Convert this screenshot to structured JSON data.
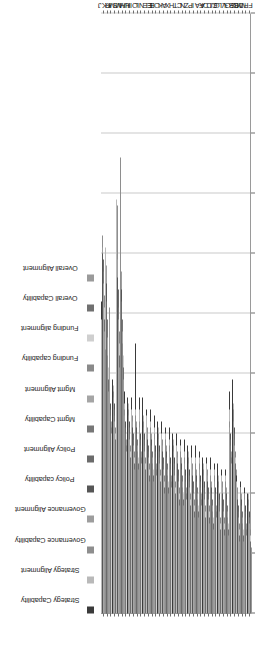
{
  "chart_data": {
    "type": "bar",
    "orientation": "horizontal",
    "title": "",
    "xlabel": "",
    "ylabel": "",
    "xlim": [
      0.0,
      5.0
    ],
    "xticks": [
      "0.00",
      "0.50",
      "1.00",
      "1.50",
      "2.00",
      "2.50",
      "3.00",
      "3.50",
      "4.00",
      "4.50",
      "5.00"
    ],
    "grid": true,
    "legend_position": "top",
    "legend": [
      {
        "label": "Strategy Capability",
        "color": "#3a3a3a"
      },
      {
        "label": "Strategy Alignment",
        "color": "#b9b9b9"
      },
      {
        "label": "Governance Capability",
        "color": "#8e8e8e"
      },
      {
        "label": "Governance Alignment",
        "color": "#9d9d9d"
      },
      {
        "label": "Policy capability",
        "color": "#565656"
      },
      {
        "label": "Policy Alignment",
        "color": "#6b6b6b"
      },
      {
        "label": "Mgmt Capability",
        "color": "#777777"
      },
      {
        "label": "Mgmt Alignment",
        "color": "#a5a5a5"
      },
      {
        "label": "Funding capability",
        "color": "#8a8a8a"
      },
      {
        "label": "Funding alignment",
        "color": "#cfcfcf"
      },
      {
        "label": "Overall Capability",
        "color": "#707070"
      },
      {
        "label": "Overall Alignment",
        "color": "#9a9a9a"
      }
    ],
    "categories": [
      "J",
      "KK",
      "R",
      "MM",
      "S",
      "W",
      "HH",
      "U",
      "II",
      "O",
      "L",
      "N",
      "EE",
      "E",
      "B",
      "O2",
      "K",
      "A",
      "X",
      "H",
      "T",
      "C",
      "N2",
      "Z",
      "P",
      "I",
      "AA",
      "F",
      "D",
      "CC",
      "JJ",
      "G",
      "LL",
      "V",
      "GG",
      "BB",
      "DD",
      "Y",
      "M",
      "FF"
    ],
    "category_labels": [
      "J",
      "KK",
      "R",
      "MM",
      "S",
      "W",
      "HH",
      "U",
      "II",
      "O",
      "L",
      "N",
      "EE",
      "E",
      "B",
      "O",
      "K",
      "A",
      "X",
      "H",
      "T",
      "C",
      "N",
      "Z",
      "P",
      "I",
      "AA",
      "F",
      "D",
      "CC",
      "JJ",
      "G",
      "LL",
      "V",
      "GG",
      "BB",
      "DD",
      "Y",
      "M",
      "FF"
    ],
    "series": [
      {
        "name": "Strategy Capability",
        "values": [
          2.6,
          1.35,
          1.95,
          1.95,
          2.05,
          3.55,
          1.85,
          1.8,
          1.8,
          2.25,
          1.8,
          1.8,
          1.7,
          1.7,
          1.65,
          1.6,
          1.6,
          1.55,
          1.55,
          1.5,
          1.5,
          1.45,
          1.45,
          1.4,
          1.4,
          1.4,
          1.35,
          1.3,
          1.3,
          1.3,
          1.25,
          1.25,
          1.2,
          1.2,
          1.85,
          1.95,
          1.15,
          1.1,
          1.05,
          1.0
        ]
      },
      {
        "name": "Strategy Alignment",
        "values": [
          2.45,
          3.05,
          1.9,
          1.9,
          3.45,
          3.35,
          1.75,
          1.75,
          1.7,
          1.7,
          1.7,
          1.65,
          1.65,
          1.6,
          1.55,
          1.55,
          1.5,
          1.5,
          1.45,
          1.45,
          1.4,
          1.4,
          1.35,
          1.35,
          1.3,
          1.3,
          1.3,
          1.25,
          1.25,
          1.2,
          1.2,
          1.15,
          1.15,
          1.15,
          1.7,
          1.75,
          1.1,
          1.05,
          1.0,
          1.0
        ]
      },
      {
        "name": "Governance Capability",
        "values": [
          3.15,
          2.2,
          2.55,
          1.85,
          3.4,
          3.8,
          1.7,
          1.7,
          1.65,
          1.65,
          1.6,
          1.6,
          1.55,
          1.55,
          1.5,
          1.5,
          1.45,
          1.45,
          1.4,
          1.4,
          1.35,
          1.35,
          1.3,
          1.3,
          1.25,
          1.25,
          1.25,
          1.2,
          1.2,
          1.15,
          1.15,
          1.1,
          1.1,
          1.1,
          1.6,
          1.7,
          1.05,
          1.05,
          1.0,
          0.95
        ]
      },
      {
        "name": "Governance Alignment",
        "values": [
          3.05,
          2.9,
          2.45,
          1.8,
          2.95,
          2.85,
          1.65,
          1.65,
          1.6,
          1.6,
          1.55,
          1.55,
          1.5,
          1.5,
          1.45,
          1.45,
          1.4,
          1.4,
          1.35,
          1.35,
          1.3,
          1.3,
          1.25,
          1.25,
          1.2,
          1.2,
          1.2,
          1.15,
          1.15,
          1.1,
          1.1,
          1.05,
          1.05,
          1.05,
          1.55,
          1.6,
          1.0,
          1.0,
          0.95,
          0.9
        ]
      },
      {
        "name": "Policy capability",
        "values": [
          3.0,
          2.75,
          1.75,
          1.75,
          2.8,
          2.7,
          1.6,
          1.6,
          1.55,
          1.55,
          1.5,
          1.5,
          1.45,
          1.45,
          1.4,
          1.4,
          1.35,
          1.35,
          1.3,
          1.3,
          1.25,
          1.25,
          1.2,
          1.2,
          1.15,
          1.15,
          1.15,
          1.1,
          1.1,
          1.05,
          1.05,
          1.0,
          1.0,
          1.0,
          1.5,
          1.55,
          0.95,
          0.95,
          0.9,
          0.85
        ]
      },
      {
        "name": "Policy Alignment",
        "values": [
          2.95,
          2.6,
          1.7,
          1.7,
          2.7,
          2.6,
          1.55,
          1.55,
          1.5,
          1.5,
          1.45,
          1.45,
          1.4,
          1.4,
          1.35,
          1.35,
          1.3,
          1.3,
          1.25,
          1.25,
          1.2,
          1.2,
          1.15,
          1.15,
          1.1,
          1.1,
          1.1,
          1.05,
          1.05,
          1.0,
          1.0,
          0.95,
          0.95,
          0.95,
          1.45,
          1.5,
          0.9,
          0.9,
          0.85,
          0.8
        ]
      },
      {
        "name": "Mgmt Capability",
        "values": [
          2.85,
          2.45,
          1.65,
          1.65,
          2.55,
          2.45,
          1.5,
          1.5,
          1.45,
          1.45,
          1.4,
          1.4,
          1.35,
          1.35,
          1.3,
          1.3,
          1.25,
          1.25,
          1.2,
          1.2,
          1.15,
          1.15,
          1.1,
          1.1,
          1.05,
          1.05,
          1.05,
          1.0,
          1.0,
          0.95,
          0.95,
          0.9,
          0.9,
          0.9,
          1.4,
          1.45,
          0.85,
          0.85,
          0.8,
          0.8
        ]
      },
      {
        "name": "Mgmt Alignment",
        "values": [
          2.75,
          2.3,
          1.6,
          1.6,
          2.45,
          2.35,
          1.45,
          1.45,
          1.4,
          1.4,
          1.35,
          1.35,
          1.3,
          1.3,
          1.25,
          1.25,
          1.2,
          1.2,
          1.15,
          1.15,
          1.1,
          1.1,
          1.05,
          1.05,
          1.0,
          1.0,
          1.0,
          0.95,
          0.95,
          0.9,
          0.9,
          0.85,
          0.85,
          0.85,
          1.35,
          1.4,
          0.8,
          0.8,
          0.75,
          0.75
        ]
      },
      {
        "name": "Funding capability",
        "values": [
          2.65,
          2.15,
          1.55,
          1.55,
          2.35,
          2.25,
          1.4,
          1.4,
          1.35,
          1.35,
          1.3,
          1.3,
          1.25,
          1.25,
          1.2,
          1.2,
          1.15,
          1.15,
          1.1,
          1.1,
          1.05,
          1.05,
          1.0,
          1.0,
          0.95,
          0.95,
          0.95,
          0.9,
          0.9,
          0.85,
          0.85,
          0.8,
          0.8,
          0.8,
          1.3,
          1.35,
          0.75,
          0.75,
          0.7,
          0.7
        ]
      },
      {
        "name": "Funding alignment",
        "values": [
          2.55,
          2.05,
          1.5,
          1.5,
          2.25,
          2.15,
          1.35,
          1.35,
          1.3,
          1.3,
          1.25,
          1.25,
          1.2,
          1.2,
          1.15,
          1.15,
          1.1,
          1.1,
          1.05,
          1.05,
          1.0,
          1.0,
          0.95,
          0.95,
          0.9,
          0.9,
          0.9,
          0.85,
          0.85,
          0.8,
          0.8,
          0.75,
          0.75,
          0.75,
          1.25,
          1.3,
          0.7,
          0.7,
          0.65,
          0.65
        ]
      },
      {
        "name": "Overall Capability",
        "values": [
          2.45,
          1.95,
          1.45,
          1.45,
          2.15,
          2.05,
          1.3,
          1.3,
          1.25,
          1.25,
          1.2,
          1.2,
          1.15,
          1.15,
          1.1,
          1.1,
          1.05,
          1.05,
          1.0,
          1.0,
          0.95,
          0.95,
          0.9,
          0.9,
          0.85,
          0.85,
          0.85,
          0.8,
          0.8,
          0.75,
          0.75,
          0.7,
          0.7,
          0.7,
          1.2,
          1.25,
          0.65,
          0.65,
          0.6,
          0.6
        ]
      },
      {
        "name": "Overall Alignment",
        "values": [
          2.35,
          1.85,
          1.4,
          1.4,
          2.05,
          1.95,
          1.25,
          1.25,
          1.2,
          1.2,
          1.15,
          1.15,
          1.1,
          1.1,
          1.05,
          1.05,
          1.0,
          1.0,
          0.95,
          0.95,
          0.9,
          0.9,
          0.85,
          0.85,
          0.8,
          0.8,
          0.8,
          0.75,
          0.75,
          0.7,
          0.7,
          0.65,
          0.65,
          0.65,
          1.15,
          1.2,
          0.6,
          0.6,
          0.55,
          0.55
        ]
      }
    ]
  }
}
